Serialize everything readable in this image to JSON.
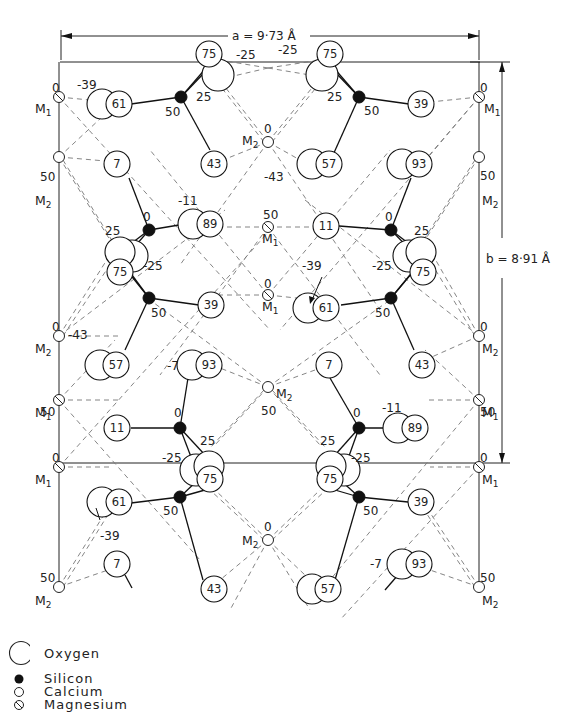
{
  "diagram": {
    "type": "crystal-structure-projection",
    "dimensions": {
      "a_label": "a = 9·73 Å",
      "b_label": "b = 8·91 Å"
    },
    "site_labels": {
      "M1": "M",
      "M1_sub": "1",
      "M2": "M",
      "M2_sub": "2"
    },
    "oxygen_heights": [
      "75",
      "61",
      "7",
      "43",
      "57",
      "39",
      "93",
      "89",
      "11",
      "25",
      "-25",
      "-39",
      "-43",
      "-7",
      "-11"
    ],
    "legend": {
      "oxygen": "Oxygen",
      "silicon": "Silicon",
      "calcium": "Calcium",
      "magnesium": "Magnesium"
    },
    "colors": {
      "line": "#111111",
      "dashed": "#777777",
      "background": "#ffffff"
    }
  }
}
